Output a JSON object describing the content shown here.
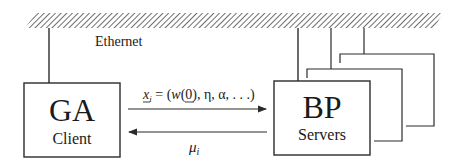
{
  "diagram": {
    "network": {
      "label": "Ethernet"
    },
    "client": {
      "title": "GA",
      "subtitle": "Client"
    },
    "server": {
      "title": "BP",
      "subtitle": "Servers",
      "stack_count": 3
    },
    "messages": {
      "request": {
        "var": "x",
        "sub": "i",
        "eq": " = (",
        "w": "w",
        "rest": "(0), η, α, . . .)",
        "direction": "client-to-server"
      },
      "response": {
        "var": "μ",
        "sub": "i",
        "direction": "server-to-client"
      }
    },
    "colors": {
      "stroke": "#2b2b2b",
      "hatch": "#555555",
      "background": "#ffffff"
    }
  }
}
